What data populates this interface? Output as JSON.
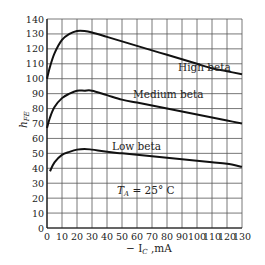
{
  "chart_data": {
    "type": "line",
    "title": "",
    "xlabel": "− I_C ,mA",
    "ylabel": "h_FE",
    "xlim": [
      0,
      130
    ],
    "ylim": [
      0,
      140
    ],
    "grid": true,
    "x_ticks": [
      0,
      10,
      20,
      30,
      40,
      50,
      60,
      70,
      80,
      90,
      100,
      110,
      120,
      130
    ],
    "y_ticks": [
      0,
      10,
      20,
      30,
      40,
      50,
      60,
      70,
      80,
      90,
      100,
      110,
      120,
      130,
      140
    ],
    "annotation": "T_A = 25°C",
    "series": [
      {
        "name": "High beta",
        "x": [
          0,
          2,
          5,
          10,
          15,
          20,
          25,
          30,
          40,
          50,
          60,
          70,
          80,
          90,
          100,
          110,
          120,
          130
        ],
        "values": [
          100,
          108,
          117,
          126,
          130,
          132,
          132,
          131,
          128,
          125,
          122,
          119,
          116,
          113,
          110,
          107,
          105,
          103
        ]
      },
      {
        "name": "Medium beta",
        "x": [
          0,
          2,
          5,
          10,
          15,
          20,
          25,
          30,
          40,
          50,
          60,
          70,
          80,
          90,
          100,
          110,
          120,
          130
        ],
        "values": [
          67,
          74,
          81,
          87,
          90,
          92,
          92,
          92,
          89,
          86,
          84,
          82,
          80,
          78,
          76,
          74,
          72,
          70
        ]
      },
      {
        "name": "Low beta",
        "x": [
          2,
          5,
          10,
          15,
          20,
          25,
          30,
          40,
          50,
          60,
          70,
          80,
          90,
          100,
          110,
          120,
          130
        ],
        "values": [
          38,
          44,
          49,
          51,
          52.5,
          53,
          52.5,
          51,
          50,
          49,
          48,
          47,
          46,
          45,
          44,
          43,
          41
        ]
      }
    ]
  },
  "labels": {
    "ylabel_main": "h",
    "ylabel_sub": "FE",
    "xlabel_prefix": "− I",
    "xlabel_sub": "C",
    "xlabel_suffix": " ,mA",
    "annotation_main": "T",
    "annotation_sub": "A",
    "annotation_rest": " = 25° C",
    "series_labels": [
      "High beta",
      "Medium beta",
      "Low beta"
    ]
  }
}
